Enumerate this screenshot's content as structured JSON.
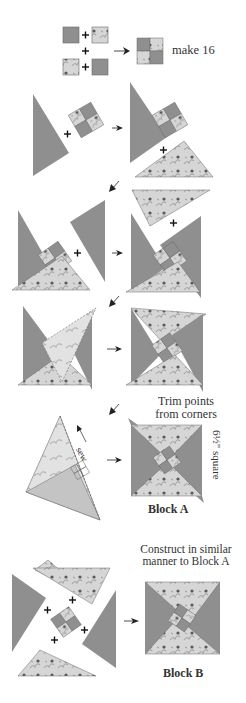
{
  "colors": {
    "dark_fabric": "#8f8f8f",
    "light_fabric": "#d6d6d6",
    "floral_print": "#4a4a4a",
    "outline": "#6a6a6a",
    "background": "#ffffff"
  },
  "steps": [
    {
      "id": "step-1",
      "description": "Four-patch: 2 dark squares + 2 floral squares",
      "note": "make 16"
    },
    {
      "id": "step-2",
      "description": "Add dark triangle to four-patch, then add floral triangle"
    },
    {
      "id": "step-3",
      "description": "Add second dark triangle, then second floral triangle"
    },
    {
      "id": "step-4",
      "description": "Add last floral triangle"
    },
    {
      "id": "step-5",
      "description": "Sew final seam, trim points",
      "sew_label": "sew",
      "trim_note": "Trim points from corners"
    },
    {
      "id": "step-6",
      "description": "Block B constructed similarly"
    }
  ],
  "labels": {
    "make_16": "make 16",
    "sew": "sew",
    "trim_line1": "Trim points",
    "trim_line2": "from corners",
    "size": "6½\" square",
    "block_a": "Block A",
    "construct_line1": "Construct in similar",
    "construct_line2": "manner to Block A",
    "block_b": "Block B"
  },
  "symbols": {
    "plus": "+",
    "arrow_right": "➤",
    "arrow_down_left": "↙"
  }
}
